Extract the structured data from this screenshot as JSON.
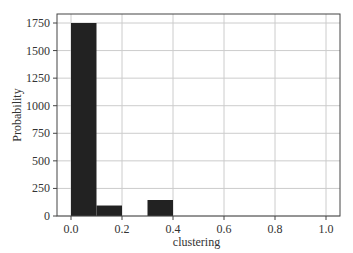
{
  "chart_data": {
    "type": "bar",
    "title": "",
    "xlabel": "clustering",
    "ylabel": "Probability",
    "bins": [
      {
        "x0": 0.0,
        "x1": 0.1,
        "value": 1750
      },
      {
        "x0": 0.1,
        "x1": 0.2,
        "value": 95
      },
      {
        "x0": 0.2,
        "x1": 0.3,
        "value": 0
      },
      {
        "x0": 0.3,
        "x1": 0.4,
        "value": 145
      },
      {
        "x0": 0.4,
        "x1": 0.5,
        "value": 0
      },
      {
        "x0": 0.5,
        "x1": 0.6,
        "value": 0
      },
      {
        "x0": 0.6,
        "x1": 0.7,
        "value": 0
      },
      {
        "x0": 0.7,
        "x1": 0.8,
        "value": 0
      },
      {
        "x0": 0.8,
        "x1": 0.9,
        "value": 0
      },
      {
        "x0": 0.9,
        "x1": 1.0,
        "value": 0
      }
    ],
    "categories": [
      "0.0-0.1",
      "0.1-0.2",
      "0.2-0.3",
      "0.3-0.4",
      "0.4-0.5",
      "0.5-0.6",
      "0.6-0.7",
      "0.7-0.8",
      "0.8-0.9",
      "0.9-1.0"
    ],
    "values": [
      1750,
      95,
      0,
      145,
      0,
      0,
      0,
      0,
      0,
      0
    ],
    "xlim": [
      -0.05,
      1.05
    ],
    "ylim": [
      0,
      1840
    ],
    "xticks": [
      0.0,
      0.2,
      0.4,
      0.6,
      0.8,
      1.0
    ],
    "xtick_labels": [
      "0.0",
      "0.2",
      "0.4",
      "0.6",
      "0.8",
      "1.0"
    ],
    "yticks": [
      0,
      250,
      500,
      750,
      1000,
      1250,
      1500,
      1750
    ],
    "ytick_labels": [
      "0",
      "250",
      "500",
      "750",
      "1000",
      "1250",
      "1500",
      "1750"
    ],
    "grid": true,
    "legend": null,
    "bar_color": "#222222",
    "grid_color": "#cccccc",
    "axis_color": "#444444"
  }
}
